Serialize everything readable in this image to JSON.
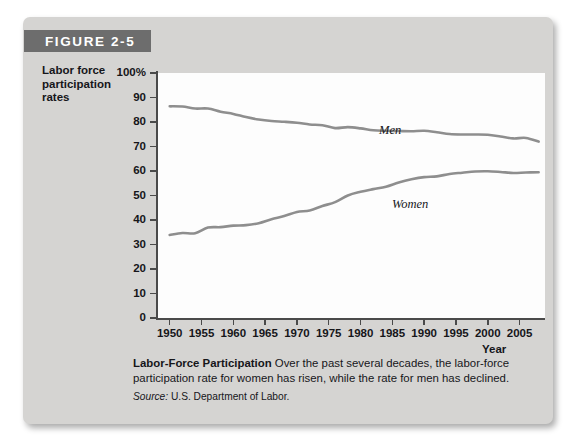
{
  "figure": {
    "banner_label": "FIGURE 2-5"
  },
  "caption": {
    "title": "Labor-Force Participation",
    "body": " Over the past several decades, the labor-force participation rate for women has risen, while the rate for men has declined.",
    "source_label": "Source:",
    "source_text": " U.S. Department of Labor."
  },
  "chart_data": {
    "type": "line",
    "title": "Labor-Force Participation",
    "xlabel": "Year",
    "ylabel": "Labor force participation rates",
    "ylabel_lines": [
      "Labor force",
      "participation",
      "rates"
    ],
    "xlim": [
      1948,
      2009
    ],
    "ylim": [
      0,
      100
    ],
    "grid": false,
    "legend_position": "inline-annotations",
    "ytick_labels": [
      "100%",
      "90",
      "80",
      "70",
      "60",
      "50",
      "40",
      "30",
      "20",
      "10",
      "0"
    ],
    "ytick_values": [
      100,
      90,
      80,
      70,
      60,
      50,
      40,
      30,
      20,
      10,
      0
    ],
    "xtick_labels": [
      "1950",
      "1955",
      "1960",
      "1965",
      "1970",
      "1975",
      "1980",
      "1985",
      "1990",
      "1995",
      "2000",
      "2005"
    ],
    "xtick_values": [
      1950,
      1955,
      1960,
      1965,
      1970,
      1975,
      1980,
      1985,
      1990,
      1995,
      2000,
      2005
    ],
    "series": [
      {
        "name": "Men",
        "color": "#8e8e8e",
        "x": [
          1950,
          1952,
          1954,
          1956,
          1958,
          1960,
          1962,
          1964,
          1966,
          1968,
          1970,
          1972,
          1974,
          1976,
          1978,
          1980,
          1982,
          1984,
          1986,
          1988,
          1990,
          1992,
          1994,
          1996,
          1998,
          2000,
          2002,
          2004,
          2006,
          2008
        ],
        "values": [
          86.4,
          86.3,
          85.5,
          85.5,
          84.2,
          83.3,
          82.0,
          81.0,
          80.4,
          80.1,
          79.7,
          79.0,
          78.7,
          77.5,
          77.9,
          77.4,
          76.6,
          76.4,
          76.3,
          76.2,
          76.4,
          75.8,
          75.1,
          74.9,
          74.9,
          74.8,
          74.1,
          73.3,
          73.5,
          72.0
        ],
        "start_value": 86.4,
        "end_value": 72.0
      },
      {
        "name": "Women",
        "color": "#8e8e8e",
        "x": [
          1950,
          1952,
          1954,
          1956,
          1958,
          1960,
          1962,
          1964,
          1966,
          1968,
          1970,
          1972,
          1974,
          1976,
          1978,
          1980,
          1982,
          1984,
          1986,
          1988,
          1990,
          1992,
          1994,
          1996,
          1998,
          2000,
          2002,
          2004,
          2006,
          2008
        ],
        "values": [
          33.9,
          34.7,
          34.6,
          36.9,
          37.1,
          37.7,
          37.9,
          38.7,
          40.3,
          41.6,
          43.3,
          43.9,
          45.7,
          47.3,
          50.0,
          51.5,
          52.6,
          53.6,
          55.3,
          56.6,
          57.5,
          57.8,
          58.8,
          59.3,
          59.8,
          59.9,
          59.6,
          59.2,
          59.4,
          59.5
        ],
        "start_value": 33.9,
        "end_value": 59.5,
        "peak_value": 60.0
      }
    ]
  }
}
